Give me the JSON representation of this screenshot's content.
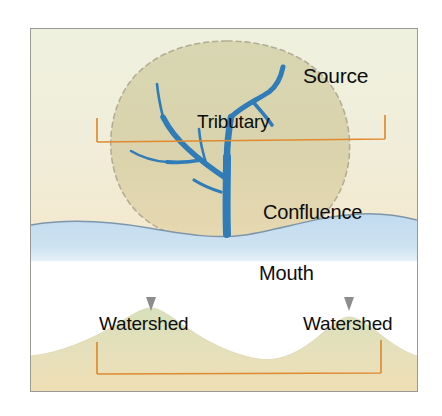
{
  "figure": {
    "frame_border_color": "#9a9a94",
    "background_color": "#ffffff"
  },
  "colors": {
    "land_upper": "#eef0dd",
    "land_lower": "#f2e4c8",
    "basin_fill": "#cfcfa8",
    "water": "#c5dcef",
    "river": "#2f7cb8",
    "bracket": "#e08a30",
    "watershed_dash": "#b8b49a",
    "coastline": "#7a93a8",
    "hill_top": "#dbe2c0",
    "hill_base": "#efdfb8",
    "arrow": "#8d8d8d",
    "text": "#0d0d0d"
  },
  "top_panel": {
    "name": "plan-view-of-drainage-basin",
    "labels": [
      {
        "id": "source",
        "text": "Source"
      },
      {
        "id": "tributary",
        "text": "Tributary"
      },
      {
        "id": "confluence",
        "text": "Confluence"
      },
      {
        "id": "mouth",
        "text": "Mouth"
      }
    ],
    "bracket": {
      "name": "watershed-extent-bracket-top",
      "color": "#e08a30",
      "description": "horizontal span bracket across drainage basin"
    },
    "basin_boundary": {
      "name": "watershed-divide-dashed-outline",
      "style": "dashed"
    },
    "water_body": {
      "name": "sea-water-area",
      "color": "#c5dcef"
    }
  },
  "bottom_panel": {
    "name": "cross-section-view-of-watersheds",
    "labels": [
      {
        "id": "watershed-left",
        "text": "Watershed"
      },
      {
        "id": "watershed-right",
        "text": "Watershed"
      }
    ],
    "markers": [
      {
        "id": "divide-marker-left",
        "icon": "triangle-down-icon"
      },
      {
        "id": "divide-marker-right",
        "icon": "triangle-down-icon"
      }
    ],
    "bracket": {
      "name": "watershed-extent-bracket-bottom",
      "color": "#e08a30",
      "description": "horizontal span bracket between two divide peaks"
    },
    "hills": [
      {
        "id": "hill-left",
        "peak_x": 120
      },
      {
        "id": "hill-right",
        "peak_x": 318
      }
    ]
  }
}
